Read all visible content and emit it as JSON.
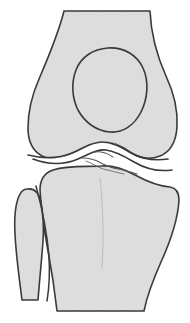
{
  "figure": {
    "title": "Knee joint anterior view line drawing",
    "type": "anatomical-line-drawing",
    "view": "anterior",
    "canvas": {
      "width": 190,
      "height": 323
    },
    "background_color": "#ffffff",
    "bone_fill_color": "#e0e0e0",
    "bone_texture_color": "#d2d2d2",
    "outline_color": "#3a3a3a",
    "outline_width": 1.6,
    "joint_space_color": "#ffffff"
  },
  "structures": [
    {
      "key": "femur",
      "label": "Femur",
      "description": "Distal femur with shaft, medial and lateral condyles",
      "fill": "#e0e0e0",
      "stroke": "#3a3a3a",
      "path": "M 64 11 L 150 11 C 151 34 157 56 166 76 C 174 93 178 110 177 127 C 176 142 170 152 160 156 C 150 160 139 158 130 152 C 120 145 110 141 100 142 C 90 143 81 149 72 154 C 62 160 51 161 42 156 C 33 151 28 141 28 128 C 28 112 32 95 39 79 C 48 58 58 35 64 11 Z"
    },
    {
      "key": "patella",
      "label": "Patella",
      "description": "Kneecap, ovoid outline superimposed over the femur",
      "fill": "none",
      "stroke": "#3a3a3a",
      "path": "M 108 48 C 124 47 137 55 143 68 C 149 81 148 98 141 112 C 134 126 122 133 110 132 C 97 131 85 123 78 110 C 72 98 71 83 76 70 C 81 57 93 49 108 48 Z"
    },
    {
      "key": "tibia",
      "label": "Tibia",
      "description": "Proximal tibia with plateau and shaft",
      "fill": "#e0e0e0",
      "stroke": "#3a3a3a",
      "path": "M 101 166 C 112 165 124 169 135 175 C 146 181 158 186 170 187 C 176 188 179 192 179 200 C 178 218 171 240 161 262 C 153 280 147 296 144 311 L 57 311 C 55 293 52 272 48 251 C 44 229 41 208 40 190 C 40 180 44 173 53 170 C 69 165 86 167 101 166 Z"
    },
    {
      "key": "fibula",
      "label": "Fibula",
      "description": "Fibular head and shaft, lateral to the tibia",
      "fill": "#e0e0e0",
      "stroke": "#3a3a3a",
      "path": "M 27 189 C 34 188 39 193 41 202 C 43 214 44 228 43 241 C 42 256 40 275 38 300 L 22 300 C 19 277 16 255 15 234 C 14 216 16 203 19 196 C 21 191 24 189 27 189 Z"
    }
  ],
  "detail_lines": [
    {
      "key": "femoral-articular-surface",
      "label": "Femoral articular surface",
      "stroke": "#3a3a3a",
      "path": "M 28 155 C 44 159 58 159 72 153 C 84 148 92 142 102 142 C 112 142 121 147 131 153 C 142 159 155 161 168 159"
    },
    {
      "key": "joint-space",
      "label": "Joint space",
      "stroke": "#3a3a3a",
      "path": "M 33 159 C 49 165 64 165 78 159 C 90 154 97 149 106 150 C 115 151 124 156 134 162 C 146 169 158 172 172 170"
    },
    {
      "key": "tibial-spine-detail",
      "label": "Tibial spine / irregular articular detail",
      "stroke": "#5a5a5a",
      "path": "M 82 158 C 90 158 96 160 101 163 C 107 166 112 168 118 169 C 124 170 131 172 137 174"
    },
    {
      "key": "tibial-spine-detail-2",
      "label": "Irregular fracture-like detail",
      "stroke": "#6a6a6a",
      "path": "M 86 161 C 92 163 97 167 103 169 C 110 171 117 172 124 174"
    },
    {
      "key": "intercondylar-notch",
      "label": "Intercondylar eminence marking",
      "stroke": "#4a4a4a",
      "path": "M 95 152 C 101 151 107 153 113 157"
    },
    {
      "key": "tibial-tuberosity-ridge",
      "label": "Anterior tibial ridge",
      "stroke": "#9a9a9a",
      "path": "M 100 178 C 103 205 104 238 102 268"
    },
    {
      "key": "fibula-overlap-edge",
      "label": "Fibula / tibia overlap edge",
      "stroke": "#3a3a3a",
      "path": "M 36 186 C 42 208 47 233 49 256 C 50 274 49 289 47 301"
    }
  ]
}
